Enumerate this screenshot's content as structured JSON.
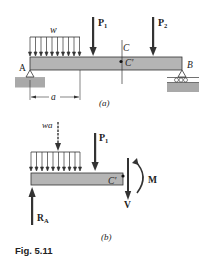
{
  "figure": {
    "caption": "Fig. 5.11",
    "colors": {
      "beam_fill": "#b5b5b5",
      "ground_fill": "#a9a9a9",
      "stroke": "#333333",
      "background": "#ffffff"
    },
    "part_a": {
      "label": "(a)",
      "load_w": "w",
      "force_p1": "P",
      "force_p1_sub": "1",
      "force_p2": "P",
      "force_p2_sub": "2",
      "point_c": "C",
      "point_c_prime": "C'",
      "support_a": "A",
      "support_b": "B",
      "dimension_a": "a"
    },
    "part_b": {
      "label": "(b)",
      "resultant_load": "wa",
      "force_p1": "P",
      "force_p1_sub": "1",
      "point_c_prime": "C'",
      "shear": "V",
      "moment": "M",
      "reaction": "R",
      "reaction_sub": "A"
    }
  }
}
